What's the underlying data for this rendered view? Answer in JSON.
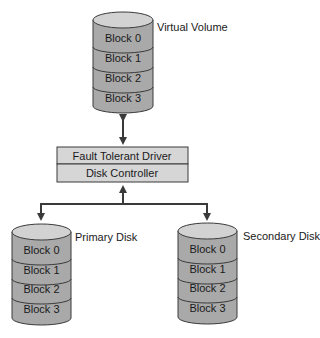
{
  "diagram": {
    "virtual_volume": {
      "label": "Virtual Volume",
      "blocks": [
        "Block 0",
        "Block 1",
        "Block 2",
        "Block 3"
      ]
    },
    "driver_stack": {
      "top": "Fault Tolerant Driver",
      "bottom": "Disk Controller"
    },
    "primary_disk": {
      "label": "Primary Disk",
      "blocks": [
        "Block 0",
        "Block 1",
        "Block 2",
        "Block 3"
      ]
    },
    "secondary_disk": {
      "label": "Secondary Disk",
      "blocks": [
        "Block 0",
        "Block 1",
        "Block 2",
        "Block 3"
      ]
    },
    "colors": {
      "cylinder_top": "#d2d2d2",
      "cylinder_body": "#a9a9a9",
      "box_fill": "#d6d6d6",
      "stroke": "#3a3a3a"
    }
  }
}
